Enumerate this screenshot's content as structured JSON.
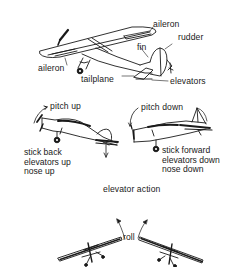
{
  "diagram": {
    "top_airplane": {
      "labels": {
        "aileron_right": "aileron",
        "aileron_left": "aileron",
        "rudder": "rudder",
        "fin": "fin",
        "tailplane": "tailplane",
        "elevators": "elevators"
      }
    },
    "pitch_up": {
      "title": "pitch up",
      "lines": [
        "stick back",
        "elevators up",
        "nose up"
      ]
    },
    "pitch_down": {
      "title": "pitch down",
      "lines": [
        "stick forward",
        "elevators down",
        "nose down"
      ]
    },
    "section_caption": "elevator action",
    "roll": {
      "label": "roll"
    },
    "colors": {
      "ink": "#1a1a1a",
      "background": "#ffffff"
    }
  }
}
